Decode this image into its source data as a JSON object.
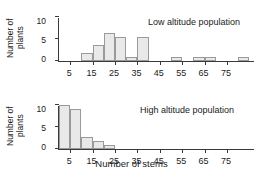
{
  "figure": {
    "xlabel": "Number of stems",
    "panels": [
      {
        "id": "low",
        "annotation": "Low altitude population",
        "ylabel": "Number of\nplants"
      },
      {
        "id": "high",
        "annotation": "High altitude population",
        "ylabel": "Number of\nplants"
      }
    ]
  },
  "chart_data": [
    {
      "type": "bar",
      "title": "Low altitude population",
      "xlabel": "Number of stems",
      "ylabel": "Number of plants",
      "xlim": [
        0,
        87.5
      ],
      "ylim": [
        0,
        11
      ],
      "grid": false,
      "legend": "none",
      "bin_width": 5,
      "xticks": [
        5,
        15,
        25,
        35,
        45,
        55,
        65,
        75
      ],
      "xtick_labels": [
        "5",
        "15",
        "25",
        "35",
        "45",
        "55",
        "65",
        "75"
      ],
      "yticks": [
        0,
        5,
        10
      ],
      "ytick_labels": [
        "0",
        "5",
        "10"
      ],
      "bin_starts": [
        0,
        5,
        10,
        15,
        20,
        25,
        30,
        35,
        40,
        45,
        50,
        55,
        60,
        65,
        70,
        75,
        80
      ],
      "values": [
        0,
        0,
        2,
        4,
        7,
        6,
        1,
        6,
        0,
        0,
        1,
        0,
        1,
        1,
        0,
        0,
        1
      ],
      "bar_fill": "#e9e9e9",
      "bar_edge": "#9a9a9a"
    },
    {
      "type": "bar",
      "title": "High altitude population",
      "xlabel": "Number of stems",
      "ylabel": "Number of plants",
      "xlim": [
        0,
        87.5
      ],
      "ylim": [
        0,
        11
      ],
      "grid": false,
      "legend": "none",
      "bin_width": 5,
      "xticks": [
        5,
        15,
        25,
        35,
        45,
        55,
        65,
        75
      ],
      "xtick_labels": [
        "5",
        "15",
        "25",
        "35",
        "45",
        "55",
        "65",
        "75"
      ],
      "yticks": [
        0,
        5,
        10
      ],
      "ytick_labels": [
        "0",
        "5",
        "10"
      ],
      "bin_starts": [
        0,
        5,
        10,
        15,
        20,
        25,
        30,
        35,
        40,
        45,
        50,
        55,
        60,
        65,
        70,
        75,
        80
      ],
      "values": [
        11,
        10,
        3,
        2,
        1,
        0,
        0,
        0,
        0,
        0,
        0,
        0,
        0,
        0,
        0,
        0,
        0
      ],
      "bar_fill": "#e9e9e9",
      "bar_edge": "#9a9a9a"
    }
  ]
}
